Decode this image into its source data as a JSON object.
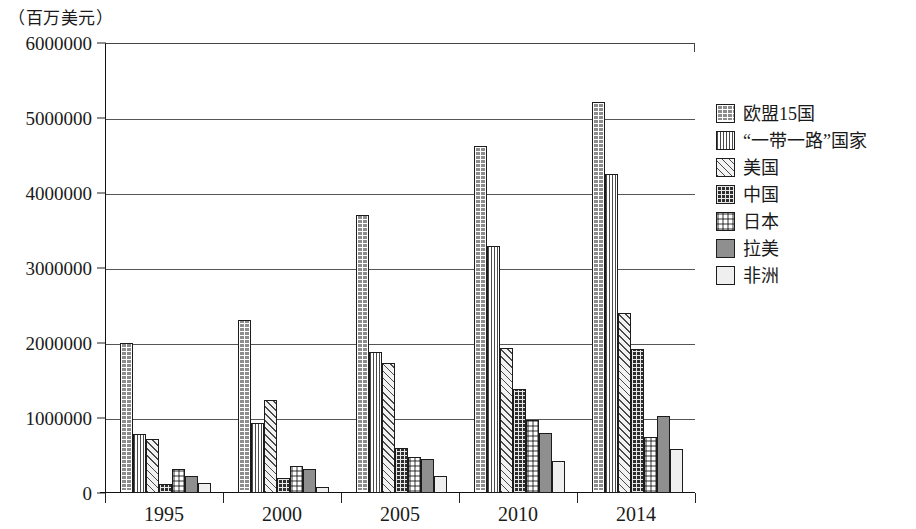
{
  "axis": {
    "unit_caption": "（百万美元）",
    "y_ticks": [
      "6000000",
      "5000000",
      "4000000",
      "3000000",
      "2000000",
      "1000000",
      "0"
    ],
    "x_labels": [
      "1995",
      "2000",
      "2005",
      "2010",
      "2014"
    ]
  },
  "legend": {
    "items": [
      {
        "label": "欧盟15国",
        "pattern": "brick",
        "color": "#8d8d8d"
      },
      {
        "label": "“一带一路”国家",
        "pattern": "vertical",
        "color": "#ffffff"
      },
      {
        "label": "美国",
        "pattern": "diagonal",
        "color": "#f2f2f2"
      },
      {
        "label": "中国",
        "pattern": "darkcheck",
        "color": "#2e2e2e"
      },
      {
        "label": "日本",
        "pattern": "check",
        "color": "#ffffff"
      },
      {
        "label": "拉美",
        "pattern": "solid",
        "color": "#8f8f8f"
      },
      {
        "label": "非洲",
        "pattern": "light",
        "color": "#efefef"
      }
    ]
  },
  "chart_data": {
    "type": "bar",
    "title": "",
    "subtitle": "",
    "xlabel": "",
    "ylabel": "（百万美元）",
    "ylim": [
      0,
      6000000
    ],
    "ytick_step": 1000000,
    "grid": true,
    "legend_position": "right",
    "categories": [
      "1995",
      "2000",
      "2005",
      "2010",
      "2014"
    ],
    "series": [
      {
        "name": "欧盟15国",
        "values": [
          2000000,
          2307000,
          3707000,
          4627000,
          5213000
        ]
      },
      {
        "name": "“一带一路”国家",
        "values": [
          787000,
          933000,
          1880000,
          3293000,
          4253000
        ]
      },
      {
        "name": "美国",
        "values": [
          720000,
          1240000,
          1733000,
          1933000,
          2400000
        ]
      },
      {
        "name": "中国",
        "values": [
          120000,
          200000,
          600000,
          1387000,
          1920000
        ]
      },
      {
        "name": "日本",
        "values": [
          320000,
          360000,
          480000,
          973000,
          747000
        ]
      },
      {
        "name": "拉美",
        "values": [
          227000,
          320000,
          453000,
          800000,
          1027000
        ]
      },
      {
        "name": "非洲",
        "values": [
          133000,
          80000,
          227000,
          427000,
          587000
        ]
      }
    ]
  }
}
